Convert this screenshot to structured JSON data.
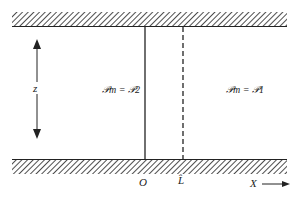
{
  "diagram": {
    "labels": {
      "z": "z",
      "region_left": "𝒫m = 𝒫2",
      "region_right": "𝒫m = 𝒫1",
      "origin": "O",
      "L": "L̂",
      "x_axis": "X"
    },
    "colors": {
      "line": "#222222",
      "background": "#ffffff"
    }
  }
}
